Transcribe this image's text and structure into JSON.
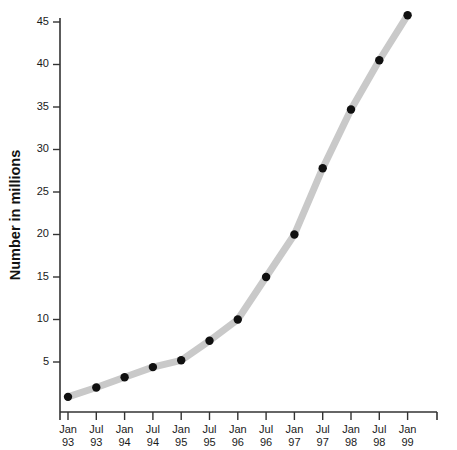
{
  "chart_data": {
    "type": "line",
    "title": "",
    "subtitle": "",
    "xlabel": "",
    "ylabel": "Number in millions",
    "categories": [
      "Jan 93",
      "Jul 93",
      "Jan 94",
      "Jul 94",
      "Jan 95",
      "Jul 95",
      "Jan 96",
      "Jul 96",
      "Jan 97",
      "Jul 97",
      "Jan 98",
      "Jul 98",
      "Jan 99"
    ],
    "category_lines": [
      [
        "Jan",
        "93"
      ],
      [
        "Jul",
        "93"
      ],
      [
        "Jan",
        "94"
      ],
      [
        "Jul",
        "94"
      ],
      [
        "Jan",
        "95"
      ],
      [
        "Jul",
        "95"
      ],
      [
        "Jan",
        "96"
      ],
      [
        "Jul",
        "96"
      ],
      [
        "Jan",
        "97"
      ],
      [
        "Jul",
        "97"
      ],
      [
        "Jan",
        "98"
      ],
      [
        "Jul",
        "98"
      ],
      [
        "Jan",
        "99"
      ]
    ],
    "values": [
      0.9,
      2.0,
      3.2,
      4.4,
      5.2,
      7.5,
      10.0,
      15.0,
      20.0,
      27.8,
      34.7,
      40.5,
      45.8
    ],
    "ylim": [
      0,
      46
    ],
    "yticks": [
      5,
      10,
      15,
      20,
      25,
      30,
      35,
      40,
      45
    ],
    "ytick_labels": [
      "5",
      "10",
      "15",
      "20",
      "25",
      "30",
      "35",
      "40",
      "45"
    ],
    "grid": false,
    "legend": false,
    "legend_position": "none",
    "line_color": "#c9c9c9",
    "marker_color": "#101010",
    "axis_color": "#333333",
    "background_color": "#ffffff",
    "line_width": 7,
    "marker_radius": 4.2
  }
}
